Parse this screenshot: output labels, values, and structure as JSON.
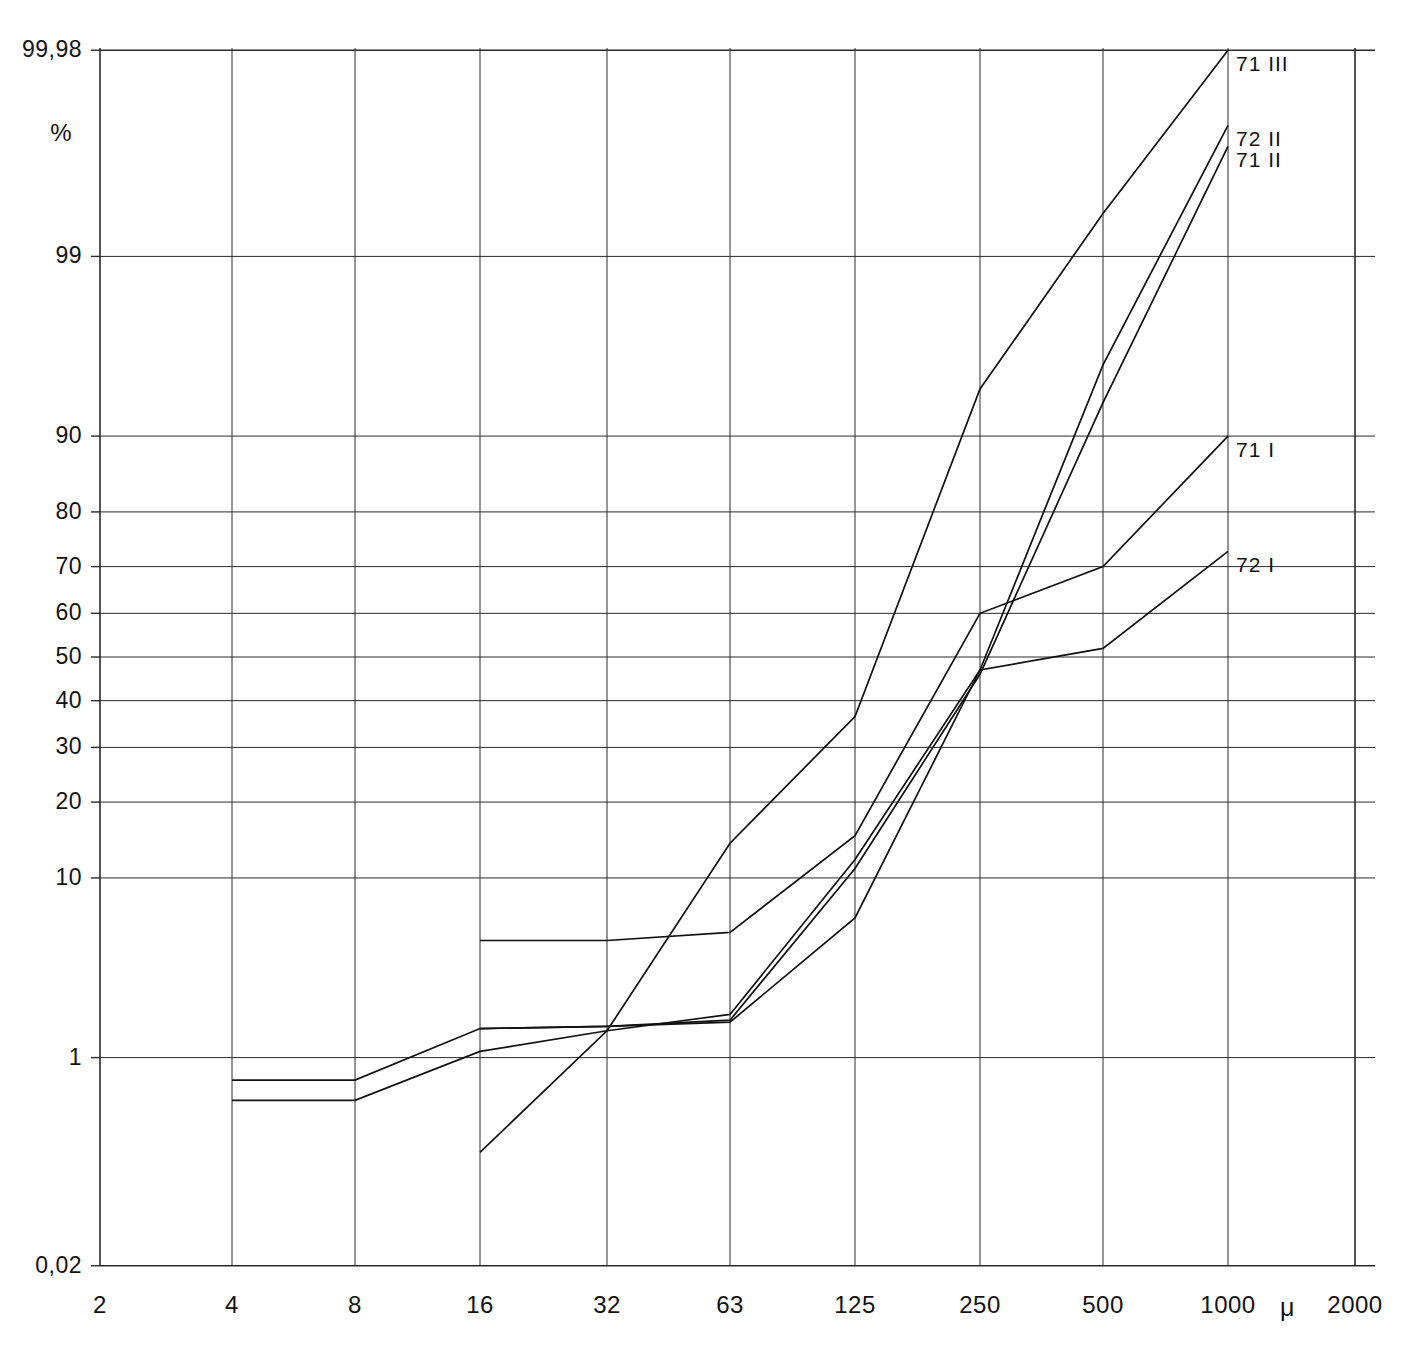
{
  "figure": {
    "top_caption": "",
    "percent_symbol": "%",
    "micron_symbol": "μ"
  },
  "chart_data": {
    "type": "line",
    "title": "",
    "subtitle": "",
    "xlabel": "μ",
    "ylabel": "%",
    "x_scale": "log2 (sieve aperture, micrometres)",
    "y_scale": "normal probability (cumulative percent)",
    "grid": true,
    "legend_position": "right-inline-at-curve-end",
    "xlim": [
      2,
      2000
    ],
    "ylim": [
      0.02,
      99.98
    ],
    "x_ticks": [
      2,
      4,
      8,
      16,
      32,
      63,
      125,
      250,
      500,
      1000,
      2000
    ],
    "x_tick_labels": [
      "2",
      "4",
      "8",
      "16",
      "32",
      "63",
      "125",
      "250",
      "500",
      "1000",
      "2000"
    ],
    "y_ticks": [
      0.02,
      1,
      10,
      20,
      30,
      40,
      50,
      60,
      70,
      80,
      90,
      99,
      99.98
    ],
    "y_tick_labels": [
      "0,02",
      "1",
      "10",
      "20",
      "30",
      "40",
      "50",
      "60",
      "70",
      "80",
      "90",
      "99",
      "99,98"
    ],
    "series": [
      {
        "name": "71 III",
        "label": "71 III",
        "color": "#111111",
        "x": [
          16,
          32,
          63,
          125,
          250,
          500,
          1000
        ],
        "y": [
          0.2,
          1.5,
          14.0,
          36.5,
          94.0,
          99.5,
          99.98
        ]
      },
      {
        "name": "72 II",
        "label": "72 II",
        "color": "#111111",
        "x": [
          4,
          8,
          16,
          32,
          63,
          125,
          250,
          500,
          1000
        ],
        "y": [
          0.5,
          0.5,
          1.1,
          1.5,
          1.9,
          12.0,
          47.0,
          95.5,
          99.9
        ]
      },
      {
        "name": "71 II",
        "label": "71 II",
        "color": "#111111",
        "x": [
          4,
          8,
          16,
          32,
          63,
          125,
          250,
          500,
          1000
        ],
        "y": [
          0.7,
          0.7,
          1.55,
          1.6,
          1.75,
          11.0,
          46.0,
          93.0,
          99.85
        ]
      },
      {
        "name": "71 I",
        "label": "71 I",
        "color": "#111111",
        "x": [
          16,
          32,
          63,
          125,
          250,
          500,
          1000
        ],
        "y": [
          5.0,
          5.0,
          5.5,
          15.0,
          60.0,
          70.0,
          90.0
        ]
      },
      {
        "name": "72 I",
        "label": "72 I",
        "color": "#111111",
        "x": [
          16,
          32,
          63,
          125,
          250,
          500,
          1000
        ],
        "y": [
          1.55,
          1.6,
          1.7,
          6.5,
          47.0,
          52.0,
          73.0
        ]
      }
    ]
  },
  "axes": {
    "y_labels": [
      {
        "text": "99,98",
        "value": 99.98
      },
      {
        "text": "%",
        "value": null
      },
      {
        "text": "99",
        "value": 99
      },
      {
        "text": "90",
        "value": 90
      },
      {
        "text": "80",
        "value": 80
      },
      {
        "text": "70",
        "value": 70
      },
      {
        "text": "60",
        "value": 60
      },
      {
        "text": "50",
        "value": 50
      },
      {
        "text": "40",
        "value": 40
      },
      {
        "text": "30",
        "value": 30
      },
      {
        "text": "20",
        "value": 20
      },
      {
        "text": "10",
        "value": 10
      },
      {
        "text": "1",
        "value": 1
      },
      {
        "text": "0,02",
        "value": 0.02
      }
    ],
    "x_labels": [
      "2",
      "4",
      "8",
      "16",
      "32",
      "63",
      "125",
      "250",
      "500",
      "1000",
      "2000"
    ]
  },
  "series_labels": [
    {
      "text": "71 III"
    },
    {
      "text": "72 II"
    },
    {
      "text": "71 II"
    },
    {
      "text": "71 I"
    },
    {
      "text": "72 I"
    }
  ]
}
